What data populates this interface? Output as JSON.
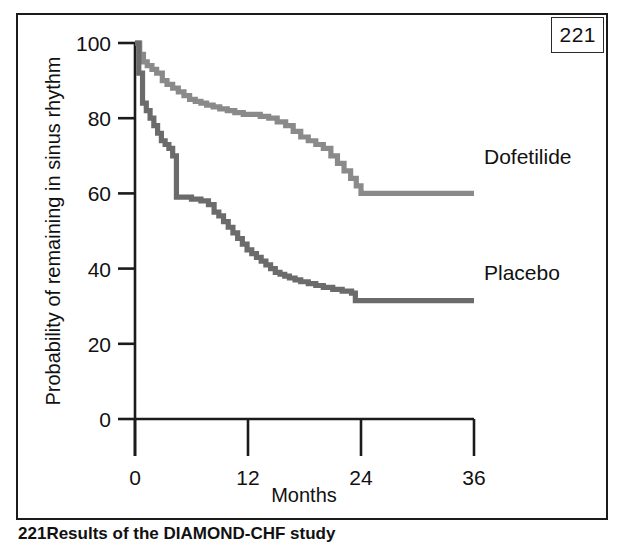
{
  "figure": {
    "page_number": "221",
    "caption_number": "221",
    "caption_text": "Results of the DIAMOND-CHF study"
  },
  "chart_data": {
    "type": "line",
    "title": "",
    "subtitle": "",
    "xlabel": "Months",
    "ylabel": "Probability of remaining in sinus rhythm",
    "xlim": [
      0,
      36
    ],
    "ylim": [
      0,
      100
    ],
    "xticks": [
      0,
      12,
      24,
      36
    ],
    "xtick_labels": [
      "0",
      "12",
      "24",
      "36"
    ],
    "yticks": [
      0,
      20,
      40,
      60,
      80,
      100
    ],
    "ytick_labels": [
      "0",
      "20",
      "40",
      "60",
      "80",
      "100"
    ],
    "grid": false,
    "legend_position": "right-inline",
    "step_type": "post",
    "series": [
      {
        "name": "Dofetilide",
        "color": "#8a8a8a",
        "label_x": 37.6,
        "label_y": 70,
        "x": [
          0,
          0.5,
          0.9,
          1.3,
          1.8,
          2.3,
          2.9,
          3.4,
          4.0,
          4.6,
          5.2,
          5.8,
          6.4,
          7.0,
          7.6,
          8.3,
          9.0,
          9.8,
          10.6,
          11.5,
          12.4,
          13.3,
          14.2,
          15.1,
          16.0,
          16.8,
          17.6,
          18.4,
          19.2,
          20.0,
          20.8,
          21.5,
          22.2,
          22.9,
          23.5,
          24.0,
          36
        ],
        "y": [
          100,
          97,
          95,
          94,
          93,
          92,
          90,
          89,
          88,
          87,
          86,
          85,
          84.5,
          84,
          83.5,
          83,
          82.5,
          82,
          81.5,
          81,
          81,
          80.5,
          80,
          79,
          78,
          76.5,
          75,
          74,
          73,
          72,
          70,
          68,
          66,
          64,
          62,
          60,
          60
        ]
      },
      {
        "name": "Placebo",
        "color": "#6b6b6b",
        "label_x": 37.6,
        "label_y": 39,
        "x": [
          0,
          0.4,
          0.8,
          1.2,
          1.6,
          2.0,
          2.4,
          2.8,
          3.2,
          3.6,
          4.0,
          4.4,
          5.0,
          6.0,
          7.0,
          7.8,
          8.4,
          8.9,
          9.4,
          9.9,
          10.4,
          10.9,
          11.4,
          11.9,
          12.4,
          12.9,
          13.4,
          13.9,
          14.4,
          14.9,
          15.4,
          15.9,
          16.4,
          17.0,
          17.6,
          18.4,
          19.2,
          20.0,
          21.0,
          22.0,
          23.0,
          23.4,
          36
        ],
        "y": [
          100,
          92,
          84,
          82,
          80,
          78,
          76,
          74,
          73,
          72,
          70,
          59,
          59,
          58.5,
          58,
          57,
          55,
          54,
          52.5,
          51,
          49.5,
          48,
          46.5,
          45,
          44,
          43,
          42,
          41,
          40,
          39,
          38.5,
          38,
          37.5,
          37,
          36.5,
          36,
          35.5,
          35,
          34.5,
          34,
          33.5,
          31.5,
          31.5
        ]
      }
    ]
  }
}
